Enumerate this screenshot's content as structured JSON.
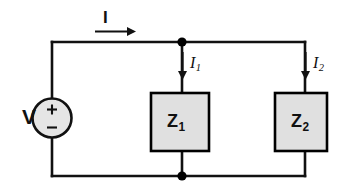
{
  "diagram": {
    "type": "electrical-schematic",
    "canvas": {
      "width": 350,
      "height": 195,
      "background": "#ffffff"
    },
    "colors": {
      "wire": "#111111",
      "component_fill": "#e0e0e0",
      "component_stroke": "#000000",
      "node": "#000000",
      "text": "#111111"
    },
    "source": {
      "label": "V",
      "plus_sign": "+",
      "minus_sign": "−",
      "shape": "circle",
      "fill": "#e5e5e5"
    },
    "currents": [
      {
        "id": "I",
        "label": "I",
        "subscript": "",
        "direction": "right",
        "style": "bold-sans"
      },
      {
        "id": "I1",
        "label": "I",
        "subscript": "1",
        "direction": "down",
        "style": "italic-serif"
      },
      {
        "id": "I2",
        "label": "I",
        "subscript": "2",
        "direction": "down",
        "style": "italic-serif"
      }
    ],
    "impedances": [
      {
        "id": "Z1",
        "label": "Z",
        "subscript": "1",
        "fill": "#e0e0e0"
      },
      {
        "id": "Z2",
        "label": "Z",
        "subscript": "2",
        "fill": "#e0e0e0"
      }
    ],
    "nodes": [
      {
        "id": "node-top",
        "x": 182,
        "y": 42
      },
      {
        "id": "node-bottom",
        "x": 182,
        "y": 176
      }
    ]
  }
}
